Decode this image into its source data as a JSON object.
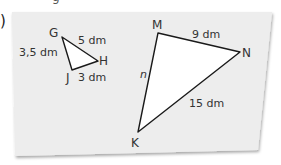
{
  "item_marker": ")",
  "top_fragment": "g",
  "colors": {
    "card": "#ededed",
    "card_shadow": "#bdbdbd",
    "triangle_fill": "#ffffff",
    "stroke": "#1a1a1a",
    "label": "#333333"
  },
  "card": {
    "corners": [
      [
        12,
        12
      ],
      [
        272,
        12
      ],
      [
        258,
        150
      ],
      [
        15,
        156
      ]
    ]
  },
  "triangle_small": {
    "name": "GHJ",
    "vertices": {
      "G": [
        62,
        37
      ],
      "H": [
        98,
        61
      ],
      "J": [
        72,
        70
      ]
    },
    "labels": {
      "G": "G",
      "H": "H",
      "J": "J",
      "GH": "5 dm",
      "GJ": "3,5 dm",
      "JH": "3 dm"
    }
  },
  "triangle_large": {
    "name": "MNK",
    "vertices": {
      "M": [
        158,
        33
      ],
      "N": [
        240,
        52
      ],
      "K": [
        138,
        132
      ]
    },
    "labels": {
      "M": "M",
      "N": "N",
      "K": "K",
      "MN": "9 dm",
      "MK": "n",
      "NK": "15 dm"
    }
  }
}
